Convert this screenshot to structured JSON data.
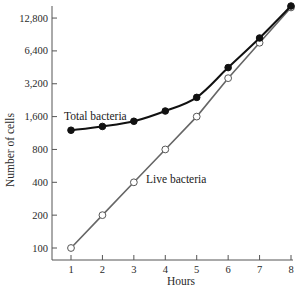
{
  "chart_data": {
    "type": "line",
    "title": "",
    "xlabel": "Hours",
    "ylabel": "Number of cells",
    "yscale": "log2",
    "x": [
      1,
      2,
      3,
      4,
      5,
      6,
      7,
      8
    ],
    "x_ticks": [
      "1",
      "2",
      "3",
      "4",
      "5",
      "6",
      "7",
      "8"
    ],
    "y_ticks": [
      100,
      200,
      400,
      800,
      1600,
      3200,
      6400,
      12800
    ],
    "y_tick_labels": [
      "100",
      "200",
      "400",
      "800",
      "1,600",
      "3,200",
      "6,400",
      "12,800"
    ],
    "ylim": [
      90,
      17000
    ],
    "xlim": [
      0.5,
      8
    ],
    "grid": false,
    "legend": "none (direct annotations)",
    "series": [
      {
        "name": "Total bacteria",
        "marker": "filled-circle",
        "color": "#111111",
        "values": [
          1200,
          1300,
          1450,
          1800,
          2400,
          4500,
          8400,
          16500
        ]
      },
      {
        "name": "Live bacteria",
        "marker": "open-circle",
        "color": "#666666",
        "values": [
          100,
          200,
          400,
          800,
          1600,
          3600,
          7600,
          16000
        ]
      }
    ],
    "annotations": [
      {
        "text": "Total bacteria",
        "near": "series 0, x≈1–3"
      },
      {
        "text": "Live bacteria",
        "near": "series 1, x≈4–6"
      }
    ]
  },
  "labels": {
    "xlabel": "Hours",
    "ylabel": "Number of cells",
    "total_label": "Total bacteria",
    "live_label": "Live bacteria"
  }
}
